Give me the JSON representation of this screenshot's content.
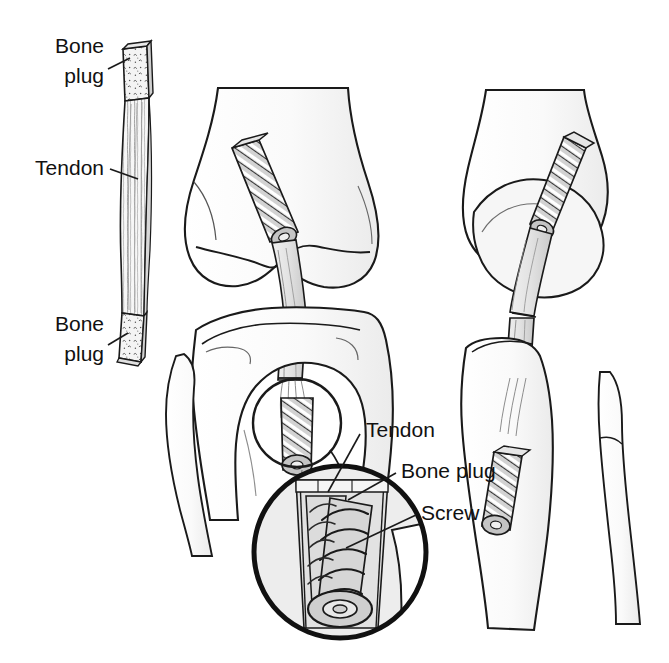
{
  "figure": {
    "background_color": "#ffffff",
    "ink_color": "#1a1a1a",
    "fill_light": "#f2f2f2",
    "fill_mid": "#d9d9d9",
    "fill_dark": "#9a9a9a",
    "width": 669,
    "height": 663
  },
  "labels": {
    "graft_bone_plug_top_line1": "Bone",
    "graft_bone_plug_top_line2": "plug",
    "graft_tendon": "Tendon",
    "graft_bone_plug_bottom_line1": "Bone",
    "graft_bone_plug_bottom_line2": "plug",
    "inset_tendon": "Tendon",
    "inset_bone_plug": "Bone plug",
    "inset_screw": "Screw"
  },
  "panels": {
    "graft_strip": {
      "name": "bone-patellar tendon-bone graft strip",
      "parts": [
        "bone plug",
        "tendon",
        "bone plug"
      ]
    },
    "anterior_knee": {
      "name": "anterior view of knee with graft through femoral and tibial tunnels",
      "parts": [
        "femur",
        "tibia",
        "fibula",
        "graft",
        "interference screw"
      ]
    },
    "lateral_knee": {
      "name": "lateral view of knee with graft and screws",
      "parts": [
        "femur",
        "tibia",
        "fibula",
        "graft",
        "interference screw"
      ]
    },
    "magnified_inset": {
      "name": "magnified detail of tibial tunnel",
      "parts": [
        "tendon",
        "bone plug",
        "screw"
      ]
    }
  }
}
